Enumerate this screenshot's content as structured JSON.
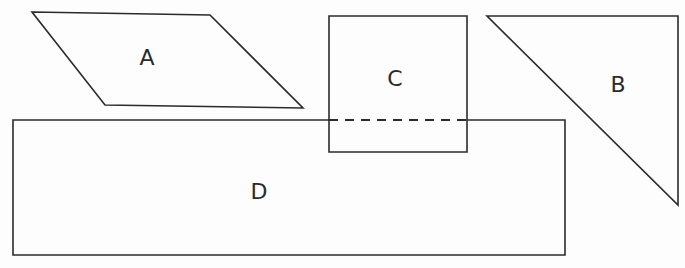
{
  "diagram": {
    "width": 685,
    "height": 268,
    "background_color": "#fdfdfd",
    "line_color": "#2b2b2b",
    "shapes": [
      {
        "id": "A",
        "label": "A",
        "kind": "parallelogram",
        "points": "32,12 210,15 303,108 105,105",
        "label_x": 147,
        "label_y": 59
      },
      {
        "id": "B",
        "label": "B",
        "kind": "right-triangle",
        "points": "487,16 678,16 678,205",
        "label_x": 618,
        "label_y": 86
      },
      {
        "id": "C",
        "label": "C",
        "kind": "square",
        "points": "329,16 467,16 467,152 329,152",
        "label_x": 395,
        "label_y": 80
      },
      {
        "id": "D",
        "label": "D",
        "kind": "rectangle",
        "points": "13,120 565,120 565,255 13,255",
        "label_x": 259,
        "label_y": 193
      }
    ],
    "hidden_edge": {
      "name": "occluded-top-edge-of-D",
      "style": "dashed",
      "x1": 329,
      "y1": 120,
      "x2": 467,
      "y2": 120
    }
  }
}
